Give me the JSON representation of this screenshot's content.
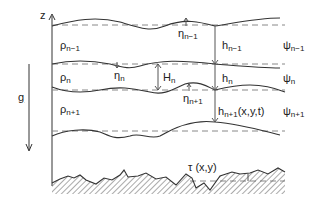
{
  "diagram": {
    "type": "multilayer-fluid-schematic",
    "axis": {
      "label": "z"
    },
    "gravity": {
      "label": "g"
    },
    "layers": [
      {
        "density": "ρ",
        "density_sub": "n−1",
        "streamfunction": "ψ",
        "stream_sub": "n−1",
        "thickness": "h",
        "thickness_sub": "n−1",
        "thickness_suffix": ""
      },
      {
        "density": "ρ",
        "density_sub": "n",
        "streamfunction": "ψ",
        "stream_sub": "n",
        "thickness": "h",
        "thickness_sub": "n",
        "thickness_suffix": "",
        "mean_thickness": "H",
        "mean_thickness_sub": "n"
      },
      {
        "density": "ρ",
        "density_sub": "n+1",
        "streamfunction": "ψ",
        "stream_sub": "n+1",
        "thickness": "h",
        "thickness_sub": "n+1",
        "thickness_suffix": "(x,y,t)"
      }
    ],
    "interface_displacements": [
      {
        "symbol": "η",
        "sub": "n−1"
      },
      {
        "symbol": "η",
        "sub": "n"
      },
      {
        "symbol": "η",
        "sub": "n+1"
      }
    ],
    "bottom": {
      "label": "τ (x,y)"
    },
    "colors": {
      "line": "#333333",
      "dashed": "#888888",
      "hatch": "#555555"
    }
  }
}
